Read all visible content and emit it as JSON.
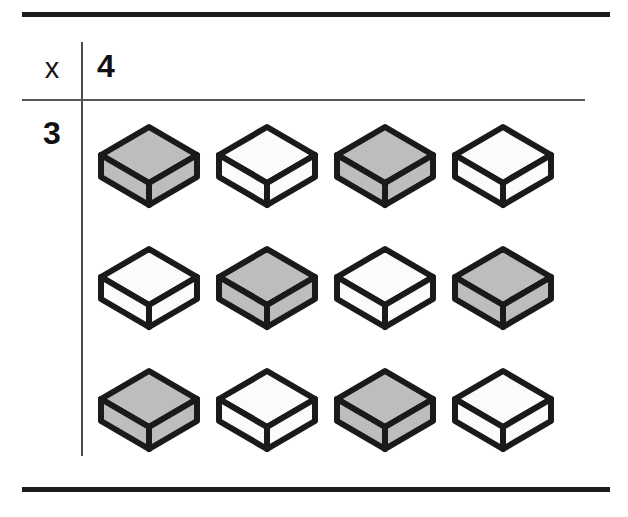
{
  "worksheet": {
    "header": {
      "variable_label": "x",
      "multiplier_label": "4"
    },
    "row_label": "3",
    "rules": {
      "top_rule": "thick-horizontal-rule",
      "header_rule": "thin-horizontal-rule",
      "bottom_rule": "thick-horizontal-rule",
      "column_divider": "vertical-rule"
    },
    "colors": {
      "block_fill_shaded": "#bdbdbd",
      "block_fill_plain": "#fbfbfb",
      "block_outline": "#1a1a1a",
      "rule_thick": "#1c1c1c",
      "rule_thin": "#57575a",
      "text": "#101012",
      "background": "#ffffff"
    },
    "blocks": {
      "rows": 3,
      "columns": 4,
      "total": 12,
      "shape": "isometric-cube",
      "grid": [
        [
          {
            "fill": "shaded",
            "label": "block-r1-c1"
          },
          {
            "fill": "plain",
            "label": "block-r1-c2"
          },
          {
            "fill": "shaded",
            "label": "block-r1-c3"
          },
          {
            "fill": "plain",
            "label": "block-r1-c4"
          }
        ],
        [
          {
            "fill": "plain",
            "label": "block-r2-c1"
          },
          {
            "fill": "shaded",
            "label": "block-r2-c2"
          },
          {
            "fill": "plain",
            "label": "block-r2-c3"
          },
          {
            "fill": "shaded",
            "label": "block-r2-c4"
          }
        ],
        [
          {
            "fill": "shaded",
            "label": "block-r3-c1"
          },
          {
            "fill": "plain",
            "label": "block-r3-c2"
          },
          {
            "fill": "shaded",
            "label": "block-r3-c3"
          },
          {
            "fill": "plain",
            "label": "block-r3-c4"
          }
        ]
      ]
    }
  }
}
